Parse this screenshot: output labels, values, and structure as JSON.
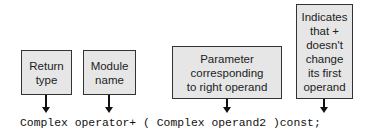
{
  "diagram": {
    "annotations": [
      {
        "id": "return-type",
        "label": "Return\ntype"
      },
      {
        "id": "module-name",
        "label": "Module\nname"
      },
      {
        "id": "parameter",
        "label": "Parameter\ncorresponding\nto right operand"
      },
      {
        "id": "const",
        "label": "Indicates\nthat +\ndoesn't\nchange\nits first\noperand"
      }
    ],
    "code_line": "Complex operator+ ( Complex operand2 )const;"
  }
}
